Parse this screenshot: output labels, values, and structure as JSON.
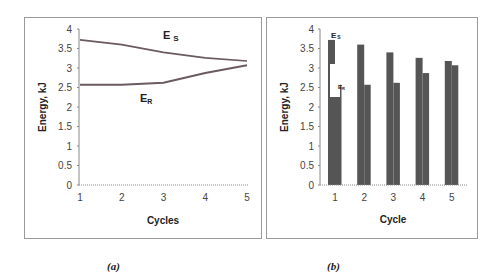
{
  "chart_data": [
    {
      "type": "line",
      "panel": "(a)",
      "title": "",
      "xlabel": "Cycles",
      "ylabel": "Energy, kJ",
      "x": [
        1,
        2,
        3,
        4,
        5
      ],
      "xticks": [
        "1",
        "2",
        "3",
        "4",
        "5"
      ],
      "yticks": [
        "0",
        "0.5",
        "1",
        "1.5",
        "2",
        "2.5",
        "3",
        "3.5",
        "4"
      ],
      "ylim": [
        0,
        4
      ],
      "grid": false,
      "series": [
        {
          "name": "E_S",
          "label": "E s",
          "values": [
            3.72,
            3.6,
            3.4,
            3.26,
            3.18
          ],
          "color": "#6b5a60"
        },
        {
          "name": "E_R",
          "label": "E R",
          "values": [
            2.57,
            2.57,
            2.62,
            2.87,
            3.07
          ],
          "color": "#6b5a60"
        }
      ],
      "annotations": [
        "E s",
        "E R"
      ]
    },
    {
      "type": "bar",
      "panel": "(b)",
      "title": "",
      "xlabel": "Cycle",
      "ylabel": "Energy, kJ",
      "categories": [
        "1",
        "2",
        "3",
        "4",
        "5"
      ],
      "yticks": [
        "0",
        "0.5",
        "1",
        "1.5",
        "2",
        "2.5",
        "3",
        "3.5",
        "4"
      ],
      "ylim": [
        0,
        4
      ],
      "grid": false,
      "series": [
        {
          "name": "E_S",
          "values": [
            3.72,
            3.6,
            3.4,
            3.26,
            3.18
          ],
          "color": "#555555"
        },
        {
          "name": "E_R",
          "values": [
            2.57,
            2.57,
            2.62,
            2.87,
            3.07
          ],
          "color": "#555555"
        }
      ],
      "annotations": [
        "E s",
        "E R"
      ]
    }
  ],
  "captions": {
    "a": "(a)",
    "b": "(b)"
  },
  "labels": {
    "a_es": "E",
    "a_es_sub": "S",
    "a_er": "E",
    "a_er_sub": "R",
    "b_es": "E",
    "b_es_sub": "S",
    "b_er": "E",
    "b_er_sub": "R"
  }
}
